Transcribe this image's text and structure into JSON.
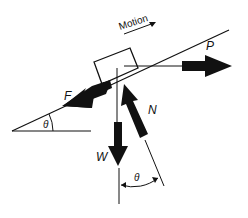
{
  "diagram": {
    "labels": {
      "motion": "Motion",
      "push": "P",
      "friction": "F",
      "normal": "N",
      "weight": "W",
      "incline_angle": "θ",
      "normal_angle": "θ"
    },
    "colors": {
      "ink": "#111111",
      "background": "#ffffff"
    }
  }
}
